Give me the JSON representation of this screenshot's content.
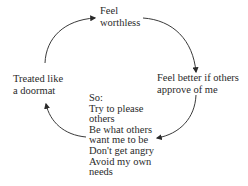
{
  "diagram": {
    "type": "cycle",
    "nodes": [
      {
        "id": "worthless",
        "lines": [
          "Feel",
          "worthless"
        ]
      },
      {
        "id": "approval",
        "lines": [
          "Feel better if others",
          "approve of me"
        ]
      },
      {
        "id": "so",
        "lines": [
          "So:",
          "Try to please",
          "others",
          "Be what others",
          "want me to be",
          "Don't get angry",
          "Avoid my own",
          "needs"
        ]
      },
      {
        "id": "doormat",
        "lines": [
          "Treated like",
          "a doormat"
        ]
      }
    ],
    "edges": [
      {
        "from": "doormat",
        "to": "worthless"
      },
      {
        "from": "worthless",
        "to": "approval"
      },
      {
        "from": "approval",
        "to": "so"
      },
      {
        "from": "so",
        "to": "doormat"
      }
    ],
    "colors": {
      "text": "#2a2a2a",
      "arrow": "#3a3a3a",
      "background": "#ffffff"
    }
  }
}
